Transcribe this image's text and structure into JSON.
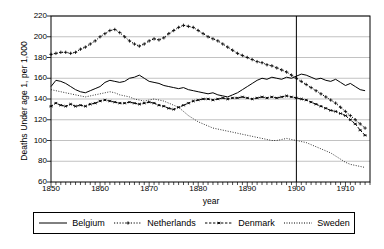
{
  "chart_data": {
    "type": "line",
    "title": "",
    "xlabel": "year",
    "ylabel": "Deaths Under age 1, per 1,000",
    "xlim": [
      1850,
      1915
    ],
    "ylim": [
      60,
      220
    ],
    "yticks": [
      60,
      80,
      100,
      120,
      140,
      160,
      180,
      200,
      220
    ],
    "xticks": [
      1850,
      1860,
      1870,
      1880,
      1890,
      1900,
      1910
    ],
    "xminor_step": 1,
    "grid": "horizontal",
    "legend_position": "below",
    "annotations": [
      {
        "name": "vertical-reference-line",
        "type": "vline",
        "x": 1900
      }
    ],
    "x": [
      1850,
      1851,
      1852,
      1853,
      1854,
      1855,
      1856,
      1857,
      1858,
      1859,
      1860,
      1861,
      1862,
      1863,
      1864,
      1865,
      1866,
      1867,
      1868,
      1869,
      1870,
      1871,
      1872,
      1873,
      1874,
      1875,
      1876,
      1877,
      1878,
      1879,
      1880,
      1881,
      1882,
      1883,
      1884,
      1885,
      1886,
      1887,
      1888,
      1889,
      1890,
      1891,
      1892,
      1893,
      1894,
      1895,
      1896,
      1897,
      1898,
      1899,
      1900,
      1901,
      1902,
      1903,
      1904,
      1905,
      1906,
      1907,
      1908,
      1909,
      1910,
      1911,
      1912,
      1913,
      1914
    ],
    "series": [
      {
        "name": "Belgium",
        "style": "solid",
        "marker": "none",
        "color": "#000000",
        "values": [
          152,
          158,
          157,
          155,
          152,
          149,
          147,
          146,
          148,
          150,
          152,
          156,
          158,
          157,
          156,
          157,
          160,
          161,
          163,
          160,
          157,
          156,
          155,
          153,
          152,
          151,
          150,
          151,
          149,
          148,
          147,
          146,
          145,
          146,
          144,
          143,
          142,
          144,
          146,
          149,
          152,
          155,
          158,
          160,
          159,
          161,
          160,
          159,
          161,
          160,
          162,
          164,
          163,
          161,
          159,
          160,
          158,
          157,
          159,
          156,
          153,
          155,
          152,
          149,
          148
        ]
      },
      {
        "name": "Netherlands",
        "style": "dotted",
        "marker": "plus",
        "color": "#000000",
        "values": [
          183,
          184,
          185,
          185,
          184,
          185,
          188,
          190,
          193,
          196,
          200,
          203,
          206,
          207,
          204,
          200,
          196,
          193,
          191,
          193,
          196,
          198,
          197,
          199,
          203,
          206,
          209,
          211,
          210,
          209,
          206,
          203,
          200,
          198,
          196,
          193,
          190,
          187,
          184,
          182,
          180,
          178,
          176,
          175,
          173,
          172,
          170,
          168,
          166,
          163,
          160,
          157,
          154,
          151,
          148,
          145,
          142,
          139,
          136,
          132,
          128,
          124,
          120,
          116,
          112
        ]
      },
      {
        "name": "Denmark",
        "style": "dashdot",
        "marker": "asterisk",
        "color": "#000000",
        "values": [
          133,
          136,
          134,
          133,
          135,
          133,
          134,
          133,
          135,
          136,
          138,
          139,
          138,
          137,
          136,
          136,
          137,
          136,
          135,
          136,
          137,
          136,
          134,
          133,
          131,
          130,
          132,
          134,
          136,
          138,
          139,
          140,
          140,
          139,
          140,
          141,
          140,
          141,
          141,
          142,
          141,
          140,
          141,
          142,
          141,
          142,
          141,
          142,
          143,
          142,
          141,
          140,
          139,
          137,
          135,
          133,
          131,
          129,
          128,
          126,
          124,
          120,
          116,
          110,
          105
        ]
      },
      {
        "name": "Sweden",
        "style": "finedot",
        "marker": "none",
        "color": "#000000",
        "values": [
          149,
          148,
          147,
          146,
          145,
          144,
          143,
          142,
          143,
          144,
          145,
          146,
          147,
          146,
          144,
          143,
          142,
          140,
          139,
          138,
          139,
          140,
          139,
          138,
          136,
          134,
          132,
          128,
          124,
          121,
          118,
          116,
          114,
          112,
          111,
          110,
          109,
          108,
          107,
          106,
          105,
          104,
          103,
          102,
          101,
          100,
          100,
          101,
          102,
          101,
          100,
          99,
          98,
          96,
          94,
          92,
          90,
          88,
          85,
          82,
          79,
          77,
          76,
          75,
          74
        ]
      }
    ]
  },
  "legend": {
    "items": [
      {
        "label": "Belgium",
        "swatch": "solid-line-swatch"
      },
      {
        "label": "Netherlands",
        "swatch": "dotted-plus-swatch"
      },
      {
        "label": "Denmark",
        "swatch": "dashed-asterisk-swatch"
      },
      {
        "label": "Sweden",
        "swatch": "fine-dotted-swatch"
      }
    ]
  },
  "axes": {
    "ylabel": "Deaths Under age 1, per 1,000",
    "xlabel": "year",
    "ytick_labels": [
      "220",
      "200",
      "180",
      "160",
      "140",
      "120",
      "100",
      "80",
      "60"
    ],
    "xtick_labels": [
      "1850",
      "1860",
      "1870",
      "1880",
      "1890",
      "1900",
      "1910"
    ]
  },
  "colors": {
    "axis": "#000000",
    "grid": "#a8a8a8",
    "series": "#000000",
    "background": "#ffffff"
  }
}
